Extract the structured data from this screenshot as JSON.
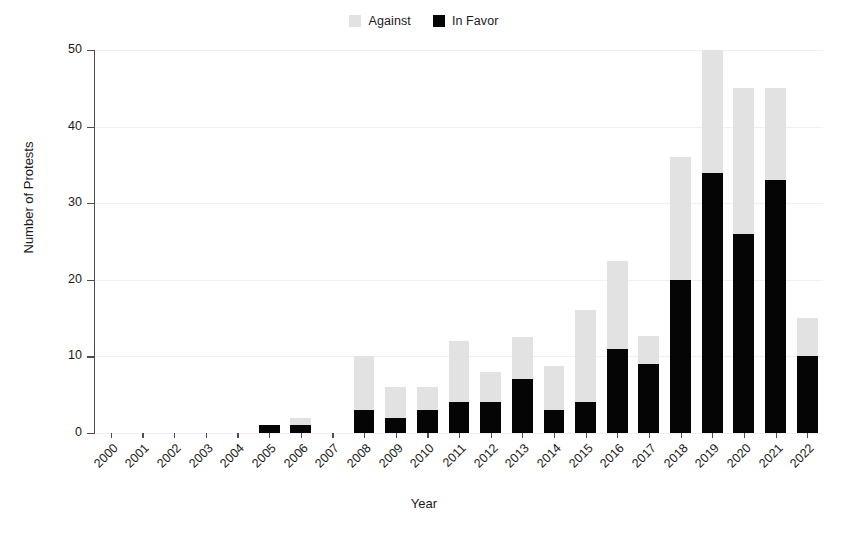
{
  "chart_data": {
    "type": "bar",
    "title": "",
    "subtitle": "",
    "xlabel": "Year",
    "ylabel": "Number of Protests",
    "ylim": [
      0,
      50
    ],
    "yticks": [
      0,
      10,
      20,
      30,
      40,
      50
    ],
    "grid": true,
    "stacked": true,
    "legend_position": "top-center",
    "legend": [
      "Against",
      "In Favor"
    ],
    "categories": [
      "2000",
      "2001",
      "2002",
      "2003",
      "2004",
      "2005",
      "2006",
      "2007",
      "2008",
      "2009",
      "2010",
      "2011",
      "2012",
      "2013",
      "2014",
      "2015",
      "2016",
      "2017",
      "2018",
      "2019",
      "2020",
      "2021",
      "2022"
    ],
    "series": [
      {
        "name": "In Favor",
        "color": "#050505",
        "values": [
          0,
          0,
          0,
          0,
          0,
          1,
          1,
          0,
          3,
          2,
          3,
          4,
          4,
          7,
          3,
          4,
          11,
          9,
          20,
          34,
          26,
          33,
          10
        ]
      },
      {
        "name": "Against",
        "color": "#e2e2e2",
        "values": [
          0,
          0,
          0,
          0,
          0,
          0,
          1,
          0,
          7,
          4,
          3,
          8,
          4,
          5.5,
          5.7,
          12,
          11.5,
          3.7,
          16,
          16,
          19,
          12,
          5
        ]
      }
    ],
    "totals": [
      0,
      0,
      0,
      0,
      0,
      1,
      2,
      0,
      10,
      6,
      6,
      12,
      8,
      12.5,
      8.7,
      16,
      22.5,
      12.7,
      36,
      50,
      45,
      45,
      15
    ]
  },
  "legend": {
    "entries": [
      {
        "label": "Against",
        "color": "#e2e2e2"
      },
      {
        "label": "In Favor",
        "color": "#050505"
      }
    ]
  },
  "axes": {
    "x_title": "Year",
    "y_title": "Number of Protests",
    "y_tick_labels": [
      "0",
      "10",
      "20",
      "30",
      "40",
      "50"
    ],
    "x_tick_labels": [
      "2000",
      "2001",
      "2002",
      "2003",
      "2004",
      "2005",
      "2006",
      "2007",
      "2008",
      "2009",
      "2010",
      "2011",
      "2012",
      "2013",
      "2014",
      "2015",
      "2016",
      "2017",
      "2018",
      "2019",
      "2020",
      "2021",
      "2022"
    ]
  }
}
